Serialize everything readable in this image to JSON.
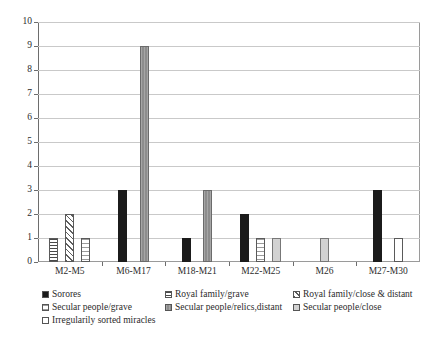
{
  "chart_data": {
    "type": "bar",
    "title": "",
    "subtitle": "",
    "xlabel": "",
    "ylabel": "",
    "ylim": [
      0,
      10
    ],
    "ytick_labels": [
      "0",
      "1",
      "2",
      "3",
      "4",
      "5",
      "6",
      "7",
      "8",
      "9",
      "10"
    ],
    "grid": true,
    "legend_position": "bottom",
    "categories": [
      "M2-M5",
      "M6-M17",
      "M18-M21",
      "M22-M25",
      "M26",
      "M27-M30"
    ],
    "series": [
      {
        "name": "Sorores",
        "pattern": "solid-black",
        "values": [
          0,
          3,
          1,
          2,
          0,
          3
        ]
      },
      {
        "name": "Royal family/grave",
        "pattern": "hlines",
        "values": [
          1,
          0,
          0,
          0,
          0,
          0
        ]
      },
      {
        "name": "Royal family/close & distant",
        "pattern": "diag",
        "values": [
          2,
          0,
          0,
          0,
          0,
          0
        ]
      },
      {
        "name": "Secular people/grave",
        "pattern": "dots",
        "values": [
          1,
          0,
          0,
          1,
          0,
          0
        ]
      },
      {
        "name": "Secular people/relics,distant",
        "pattern": "solid-gray",
        "values": [
          0,
          9,
          3,
          0,
          0,
          0
        ]
      },
      {
        "name": "Secular people/close",
        "pattern": "lightgray",
        "values": [
          0,
          0,
          0,
          1,
          1,
          0
        ]
      },
      {
        "name": "Irregularily sorted miracles",
        "pattern": "white",
        "values": [
          0,
          0,
          0,
          0,
          0,
          1
        ]
      }
    ]
  },
  "legend": {
    "rows": [
      [
        {
          "label": "Sorores",
          "pattern": "solid-black"
        },
        {
          "label": "Royal family/grave",
          "pattern": "hlines"
        },
        {
          "label": "Royal family/close & distant",
          "pattern": "diag"
        }
      ],
      [
        {
          "label": "Secular people/grave",
          "pattern": "dots"
        },
        {
          "label": "Secular people/relics,distant",
          "pattern": "solid-gray"
        },
        {
          "label": "Secular people/close",
          "pattern": "lightgray"
        }
      ],
      [
        {
          "label": "Irregularily sorted miracles",
          "pattern": "white"
        }
      ]
    ]
  },
  "colors": {
    "solid_black": "#1b1b1b",
    "solid_gray": "#8d8d8d",
    "light_gray": "#d2d2d2",
    "grid": "#c9c9c9",
    "axis": "#6d6d6d",
    "background": "#ffffff",
    "text": "#2b2b2b"
  }
}
